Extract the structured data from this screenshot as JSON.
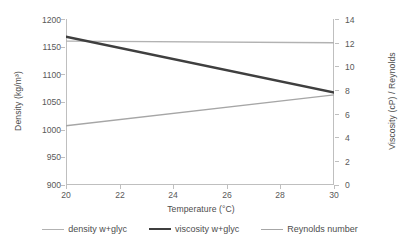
{
  "chart_data": {
    "type": "line",
    "title": "",
    "xlabel": "Temperature (°C)",
    "ylabel": "Density (kg/m³)",
    "y2label": "Viscosity (cP) / Reynolds",
    "xlim": [
      20,
      30
    ],
    "ylim": [
      900,
      1200
    ],
    "y2lim": [
      0,
      14
    ],
    "xticks": [
      20,
      22,
      24,
      26,
      28,
      30
    ],
    "yticks": [
      900,
      950,
      1000,
      1050,
      1100,
      1150,
      1200
    ],
    "y2ticks": [
      0,
      2,
      4,
      6,
      8,
      10,
      12,
      14
    ],
    "grid": false,
    "legend_position": "bottom",
    "x": [
      20,
      30
    ],
    "series": [
      {
        "name": "density w+glyc",
        "axis": "left",
        "unit": "kg/m³",
        "color": "#b2b2b2",
        "width": 1.4,
        "values": [
          1160,
          1157
        ]
      },
      {
        "name": "viscosity w+glyc",
        "axis": "right",
        "unit": "cP",
        "color": "#3f3f3f",
        "width": 2.4,
        "values": [
          12.5,
          7.8
        ]
      },
      {
        "name": "Reynolds number",
        "axis": "right",
        "unit": "",
        "color": "#a6a6a6",
        "width": 1.4,
        "values": [
          5.0,
          7.6
        ]
      }
    ]
  },
  "axes": {
    "x_title": "Temperature (°C)",
    "y_left_title": "Density (kg/m³)",
    "y_right_title": "Viscosity (cP) / Reynolds",
    "x_tick_labels": [
      "20",
      "22",
      "24",
      "26",
      "28",
      "30"
    ],
    "y_left_tick_labels": [
      "1200",
      "1150",
      "1100",
      "1050",
      "1000",
      "950",
      "900"
    ],
    "y_right_tick_labels": [
      "14",
      "12",
      "10",
      "8",
      "6",
      "4",
      "2",
      "0"
    ]
  },
  "legend": {
    "items": [
      {
        "label": "density w+glyc",
        "color": "#b2b2b2",
        "width": "1.4px"
      },
      {
        "label": "viscosity w+glyc",
        "color": "#3f3f3f",
        "width": "2.4px"
      },
      {
        "label": "Reynolds number",
        "color": "#a6a6a6",
        "width": "1.4px"
      }
    ]
  },
  "colors": {
    "frame": "#bfbfbf",
    "text": "#595959",
    "background": "#ffffff"
  }
}
